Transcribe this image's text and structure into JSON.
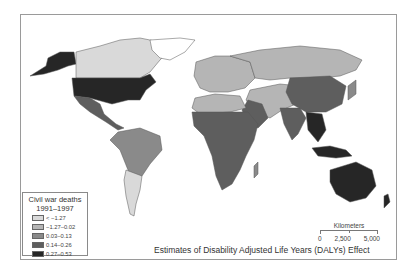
{
  "legend": {
    "title_line1": "Civil war deaths",
    "title_line2": "1991–1997",
    "items": [
      {
        "label": "< −1.27",
        "color": "#d9d9d9"
      },
      {
        "label": "−1.27–0.02",
        "color": "#b5b5b5"
      },
      {
        "label": "0.03–0.13",
        "color": "#8a8a8a"
      },
      {
        "label": "0.14–0.26",
        "color": "#5e5e5e"
      },
      {
        "label": "0.27–0.53",
        "color": "#262626"
      }
    ]
  },
  "scale_bar": {
    "title": "Kilometers",
    "ticks": [
      "0",
      "2,500",
      "5,000"
    ]
  },
  "caption": "Estimates of Disability Adjusted Life Years (DALYs) Effect"
}
